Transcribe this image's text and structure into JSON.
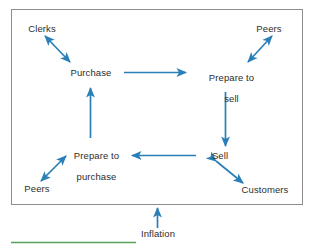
{
  "diagram": {
    "frame": {
      "border_color": "#888888",
      "background": "#ffffff"
    },
    "arrow_color": "#2a7fb8",
    "text_color": "#2d2d2d",
    "accent_rule_color": "#5a9f5a",
    "nodes": [
      {
        "id": "clerks",
        "label": "Clerks",
        "kind": "actor",
        "position": "top-left"
      },
      {
        "id": "peers-top",
        "label": "Peers",
        "kind": "actor",
        "position": "top-right"
      },
      {
        "id": "purchase",
        "label": "Purchase",
        "kind": "process",
        "position": "upper-left-center"
      },
      {
        "id": "prepare-to-sell",
        "label": "Prepare to\nsell",
        "line1": "Prepare to",
        "line2": "sell",
        "kind": "process",
        "position": "upper-right-center"
      },
      {
        "id": "prepare-to-purchase",
        "label": "Prepare to\npurchase",
        "line1": "Prepare to",
        "line2": "purchase",
        "kind": "process",
        "position": "lower-left-center"
      },
      {
        "id": "sell",
        "label": "Sell",
        "kind": "process",
        "position": "lower-right-center"
      },
      {
        "id": "peers-bottom",
        "label": "Peers",
        "kind": "actor",
        "position": "bottom-left"
      },
      {
        "id": "customers",
        "label": "Customers",
        "kind": "actor",
        "position": "bottom-right"
      },
      {
        "id": "inflation",
        "label": "Inflation",
        "kind": "external-factor",
        "position": "below-frame"
      }
    ],
    "edges": [
      {
        "id": "purchase-to-prepare-to-sell",
        "from": "purchase",
        "to": "prepare-to-sell",
        "direction": "one-way"
      },
      {
        "id": "prepare-to-sell-to-sell",
        "from": "prepare-to-sell",
        "to": "sell",
        "direction": "one-way"
      },
      {
        "id": "sell-to-prepare-to-purchase",
        "from": "sell",
        "to": "prepare-to-purchase",
        "direction": "one-way"
      },
      {
        "id": "prepare-to-purchase-to-purchase",
        "from": "prepare-to-purchase",
        "to": "purchase",
        "direction": "one-way"
      },
      {
        "id": "clerks-purchase",
        "from": "clerks",
        "to": "purchase",
        "direction": "two-way"
      },
      {
        "id": "peers-top-prepare-to-sell",
        "from": "peers-top",
        "to": "prepare-to-sell",
        "direction": "two-way"
      },
      {
        "id": "peers-bottom-prepare-to-purchase",
        "from": "peers-bottom",
        "to": "prepare-to-purchase",
        "direction": "two-way"
      },
      {
        "id": "sell-customers",
        "from": "sell",
        "to": "customers",
        "direction": "two-way"
      },
      {
        "id": "inflation-into-cycle",
        "from": "inflation",
        "to": "cycle",
        "direction": "one-way"
      }
    ]
  }
}
